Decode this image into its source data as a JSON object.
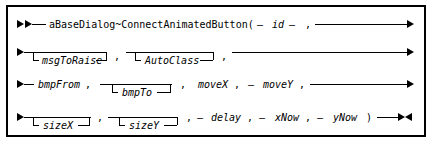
{
  "diagram": {
    "kind": "railroad-syntax-diagram",
    "title": "aBaseDialog~ConnectAnimatedButton",
    "frame_color": "#000000",
    "background_color": "#ffffff",
    "text_color": "#000000",
    "start_marker": "double-right-arrow",
    "end_marker": "right-left-arrow-pair",
    "rows": [
      {
        "index": 1,
        "name": "row-1",
        "tokens": [
          {
            "id": "t_name",
            "text": "aBaseDialog~ConnectAnimatedButton(",
            "style": "literal"
          },
          {
            "id": "t_dash1",
            "text": "—",
            "style": "literal"
          },
          {
            "id": "t_id",
            "text": "id",
            "style": "variable"
          },
          {
            "id": "t_dash2",
            "text": "—",
            "style": "literal"
          },
          {
            "id": "t_c1",
            "text": ",",
            "style": "literal"
          }
        ]
      },
      {
        "index": 2,
        "name": "row-2",
        "tokens": [
          {
            "id": "t_msgToRaise",
            "text": "msgToRaise",
            "style": "variable",
            "optional": true
          },
          {
            "id": "t_c2",
            "text": ",",
            "style": "literal"
          },
          {
            "id": "t_AutoClass",
            "text": "AutoClass",
            "style": "variable",
            "optional": true
          },
          {
            "id": "t_c3",
            "text": ",",
            "style": "literal"
          }
        ]
      },
      {
        "index": 3,
        "name": "row-3",
        "tokens": [
          {
            "id": "t_bmpFrom",
            "text": "bmpFrom",
            "style": "variable"
          },
          {
            "id": "t_c4",
            "text": ",",
            "style": "literal"
          },
          {
            "id": "t_bmpTo",
            "text": "bmpTo",
            "style": "variable",
            "optional": true
          },
          {
            "id": "t_c5",
            "text": ",",
            "style": "literal"
          },
          {
            "id": "t_moveX",
            "text": "moveX",
            "style": "variable"
          },
          {
            "id": "t_c6",
            "text": ",",
            "style": "literal"
          },
          {
            "id": "t_dash3",
            "text": "—",
            "style": "literal"
          },
          {
            "id": "t_moveY",
            "text": "moveY",
            "style": "variable"
          },
          {
            "id": "t_c7",
            "text": ",",
            "style": "literal"
          }
        ]
      },
      {
        "index": 4,
        "name": "row-4",
        "tokens": [
          {
            "id": "t_sizeX",
            "text": "sizeX",
            "style": "variable",
            "optional": true
          },
          {
            "id": "t_c8",
            "text": ",",
            "style": "literal"
          },
          {
            "id": "t_sizeY",
            "text": "sizeY",
            "style": "variable",
            "optional": true
          },
          {
            "id": "t_c9",
            "text": ",",
            "style": "literal"
          },
          {
            "id": "t_dash4",
            "text": "—",
            "style": "literal"
          },
          {
            "id": "t_delay",
            "text": "delay",
            "style": "variable"
          },
          {
            "id": "t_c10",
            "text": ",",
            "style": "literal"
          },
          {
            "id": "t_dash5",
            "text": "—",
            "style": "literal"
          },
          {
            "id": "t_xNow",
            "text": "xNow",
            "style": "variable"
          },
          {
            "id": "t_c11",
            "text": ",",
            "style": "literal"
          },
          {
            "id": "t_dash6",
            "text": "—",
            "style": "literal"
          },
          {
            "id": "t_yNow",
            "text": "yNow",
            "style": "variable"
          },
          {
            "id": "t_rparen",
            "text": ")",
            "style": "literal"
          }
        ]
      }
    ],
    "labels": {
      "name": "aBaseDialog~ConnectAnimatedButton(",
      "id": "id",
      "msgToRaise": "msgToRaise",
      "AutoClass": "AutoClass",
      "bmpFrom": "bmpFrom",
      "bmpTo": "bmpTo",
      "moveX": "moveX",
      "moveY": "moveY",
      "sizeX": "sizeX",
      "sizeY": "sizeY",
      "delay": "delay",
      "xNow": "xNow",
      "yNow": "yNow",
      "comma": ",",
      "dash": "—",
      "rparen": ")"
    }
  }
}
